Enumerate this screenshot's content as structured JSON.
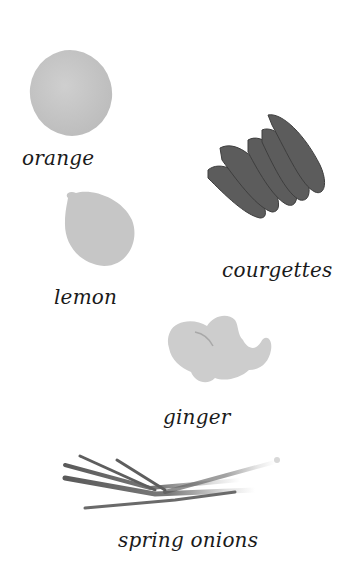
{
  "items": [
    {
      "id": "orange",
      "label": "orange"
    },
    {
      "id": "courgettes",
      "label": "courgettes"
    },
    {
      "id": "lemon",
      "label": "lemon"
    },
    {
      "id": "ginger",
      "label": "ginger"
    },
    {
      "id": "spring_onions",
      "label": "spring onions"
    }
  ],
  "colors": {
    "citrus": "#c4c4c4",
    "courgette": "#5a5a5a",
    "ginger": "#cbcbcb",
    "onion": "#6a6a6a",
    "text": "#1a1a1a"
  }
}
